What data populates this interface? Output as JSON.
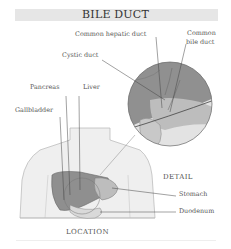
{
  "title": "BILE DUCT",
  "labels": {
    "common_hepatic_duct": "Common hepatic duct",
    "common_bile_duct_1": "Common",
    "common_bile_duct_2": "bile duct",
    "cystic_duct": "Cystic duct",
    "pancreas": "Pancreas",
    "liver": "Liver",
    "gallbladder": "Gallbladder",
    "detail": "DETAIL",
    "stomach": "Stomach",
    "duodenum": "Duodenum",
    "location": "LOCATION"
  },
  "colors": {
    "title_bar": "#e6e6e6",
    "liver_dark": "#8f8f8f",
    "organ_mid": "#bdbdbd",
    "organ_light": "#d9d9d9",
    "body_fill": "#efefef",
    "line": "#555555"
  }
}
